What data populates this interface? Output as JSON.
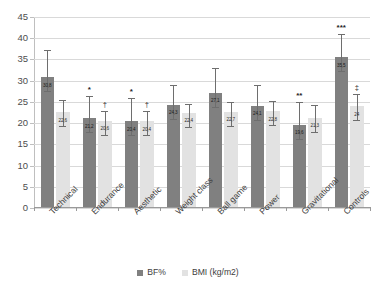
{
  "chart_data": {
    "type": "bar",
    "title": "",
    "xlabel": "",
    "ylabel": "",
    "ylim": [
      0,
      45
    ],
    "ytick_step": 5,
    "yticks": [
      "0",
      "5",
      "10",
      "15",
      "20",
      "25",
      "30",
      "35",
      "40",
      "45"
    ],
    "grid": true,
    "legend_position": "bottom-center",
    "decimal_separator": ",",
    "categories": [
      "Technical",
      "Endurance",
      "Aesthetic",
      "Weight class",
      "Ball game",
      "Power",
      "Gravitational",
      "Controls"
    ],
    "series": [
      {
        "name": "BF%",
        "color": "#808080",
        "values": [
          30.8,
          21.2,
          20.4,
          24.3,
          27.1,
          24.1,
          19.6,
          35.5
        ],
        "labels": [
          "30,8",
          "21,2",
          "20,4",
          "24,3",
          "27,1",
          "24,1",
          "19,6",
          "35,5"
        ],
        "errors": [
          6.5,
          5.2,
          5.4,
          4.7,
          6.0,
          4.9,
          5.3,
          5.6
        ],
        "significance": [
          "",
          "*",
          "*",
          "",
          "",
          "",
          "**",
          "***"
        ]
      },
      {
        "name": "BMI (kg/m2)",
        "color": "#e2e2e2",
        "values": [
          22.6,
          20.6,
          20.4,
          22.4,
          22.7,
          22.8,
          21.3,
          24.0
        ],
        "labels": [
          "22,6",
          "20,6",
          "20,4",
          "22,4",
          "22,7",
          "22,8",
          "21,3",
          "24"
        ],
        "errors": [
          2.8,
          2.3,
          2.4,
          2.2,
          2.3,
          2.3,
          3.0,
          2.9
        ],
        "significance": [
          "",
          "†",
          "†",
          "",
          "",
          "",
          "",
          "‡"
        ]
      }
    ],
    "legend": [
      {
        "label": "BF%",
        "color": "#808080"
      },
      {
        "label": "BMI (kg/m2)",
        "color": "#e2e2e2"
      }
    ],
    "annotations": [
      {
        "symbol": "*",
        "meaning": "significance-level-1"
      },
      {
        "symbol": "**",
        "meaning": "significance-level-2"
      },
      {
        "symbol": "***",
        "meaning": "significance-level-3"
      },
      {
        "symbol": "†",
        "meaning": "dagger-significance"
      },
      {
        "symbol": "‡",
        "meaning": "double-dagger-significance"
      }
    ]
  }
}
